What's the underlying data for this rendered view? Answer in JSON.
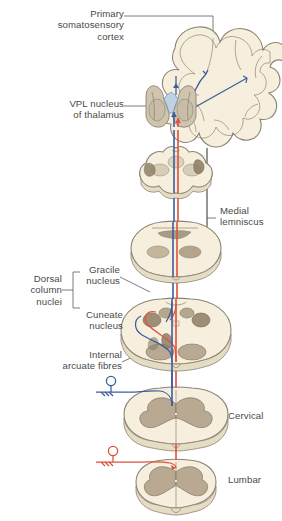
{
  "figure": {
    "type": "anatomical-diagram"
  },
  "labels": {
    "primary_somatosensory_cortex": "Primary\nsomatosensory\ncortex",
    "vpl_nucleus_of_thalamus": "VPL nucleus\nof thalamus",
    "medial_lemniscus": "Medial\nlemniscus",
    "dorsal_column_nuclei": "Dorsal\ncolumn\nnuclei",
    "gracile_nucleus": "Gracile\nnucleus",
    "cuneate_nucleus": "Cuneate\nnucleus",
    "internal_arcuate_fibres": "Internal\narcuate fibres",
    "cervical": "Cervical",
    "lumbar": "Lumbar"
  },
  "colors": {
    "tissue_fill": "#f6efdd",
    "tissue_edge": "#8d8374",
    "gray_matter": "#b9a892",
    "gray_matter_dark": "#8f8169",
    "thalamus_fill": "#cfc4ae",
    "thalamus_inner": "#b9cede",
    "blue_tract": "#3c5d9e",
    "red_tract": "#e0503a",
    "leader_line": "#5a5a5a",
    "text": "#4a4a4a",
    "background": "#ffffff"
  },
  "structures": [
    {
      "name": "cerebral-hemisphere-coronal-section",
      "level": "cerebrum"
    },
    {
      "name": "thalamus-with-vpl-nucleus",
      "level": "diencephalon"
    },
    {
      "name": "midbrain-section",
      "level": "midbrain"
    },
    {
      "name": "pons-section",
      "level": "pons"
    },
    {
      "name": "medulla-section",
      "level": "medulla"
    },
    {
      "name": "cervical-spinal-cord-section",
      "level": "cervical"
    },
    {
      "name": "lumbar-spinal-cord-section",
      "level": "lumbar"
    }
  ],
  "tracts": [
    {
      "name": "upper-limb-fibres",
      "color": "#3c5d9e",
      "origin": "cervical"
    },
    {
      "name": "lower-limb-fibres",
      "color": "#e0503a",
      "origin": "lumbar"
    }
  ]
}
